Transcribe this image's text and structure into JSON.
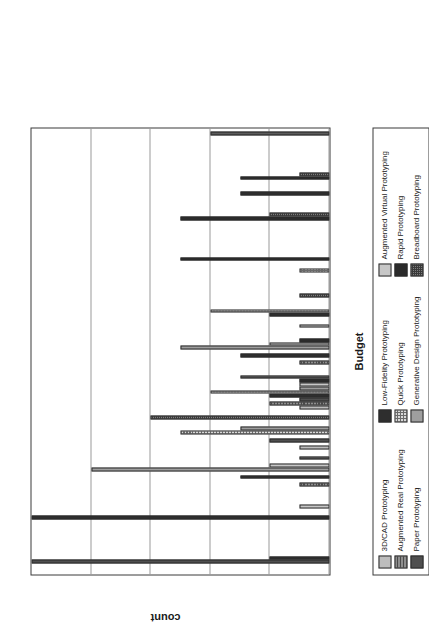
{
  "chart_data": {
    "type": "bar",
    "title": "",
    "xlabel": "Budget",
    "ylabel": "count",
    "categories": [
      "0",
      "1",
      "2",
      "3",
      "4",
      "5",
      "6",
      "7",
      "8",
      "9",
      "10"
    ],
    "xlim": [
      -0.5,
      10.5
    ],
    "ylim": [
      0,
      10
    ],
    "yticks": [
      "0",
      "2",
      "4",
      "6",
      "8",
      "10"
    ],
    "ytick_values": [
      0,
      2,
      4,
      6,
      8,
      10
    ],
    "grid": true,
    "legend_position": "below-plot",
    "orientation": "rotated-90-ccw",
    "series": [
      {
        "name": "3D/CAD Prototyping",
        "swatch": "#bdbdbd",
        "pattern": "solid-light-gray",
        "values": [
          0,
          0,
          0,
          1,
          1,
          0,
          1,
          0,
          0,
          0,
          0
        ]
      },
      {
        "name": "Augmented Real Prototyping",
        "swatch": "#8e8e8e",
        "pattern": "horizontal-lines",
        "values": [
          0,
          0,
          1,
          0,
          2,
          1,
          0,
          0,
          0,
          0,
          0
        ]
      },
      {
        "name": "Paper Prototyping",
        "swatch": "#4f4f4f",
        "pattern": "solid-dark-gray",
        "values": [
          10,
          0,
          0,
          2,
          1,
          0,
          0,
          0,
          0,
          0,
          0
        ]
      },
      {
        "name": "Low-Fidelity Prototyping",
        "swatch": "#2e2e2e",
        "pattern": "solid-near-black",
        "values": [
          2,
          10,
          3,
          0,
          2,
          3,
          2,
          0,
          0,
          3,
          0
        ]
      },
      {
        "name": "Quick Prototyping",
        "swatch": "#d9d9d9",
        "pattern": "fine-checker",
        "values": [
          0,
          0,
          0,
          5,
          4,
          0,
          4,
          1,
          0,
          0,
          0
        ]
      },
      {
        "name": "Generative Design Prototyping",
        "swatch": "#9e9e9e",
        "pattern": "solid-mid-gray",
        "values": [
          0,
          0,
          8,
          3,
          1,
          5,
          0,
          0,
          0,
          0,
          0
        ]
      },
      {
        "name": "Augmented Virtual Prototyping",
        "swatch": "#c7c7c7",
        "pattern": "solid-pale-gray",
        "values": [
          0,
          1,
          2,
          0,
          1,
          2,
          0,
          0,
          0,
          0,
          0
        ]
      },
      {
        "name": "Rapid Prototyping",
        "swatch": "#2b2b2b",
        "pattern": "solid-black",
        "values": [
          0,
          0,
          0,
          0,
          1,
          1,
          0,
          5,
          5,
          3,
          0
        ]
      },
      {
        "name": "Breadboard Prototyping",
        "swatch": "#7d7d7d",
        "pattern": "dense-checker",
        "values": [
          0,
          0,
          1,
          6,
          3,
          0,
          1,
          0,
          2,
          1,
          4
        ]
      }
    ]
  },
  "axis": {
    "ylabel": "count",
    "xlabel": "Budget",
    "ytick_labels": [
      "0",
      "2",
      "4",
      "6",
      "8",
      "10"
    ],
    "xtick_labels": [
      "0",
      "1",
      "2",
      "3",
      "4",
      "5",
      "6",
      "7",
      "8",
      "9",
      "10"
    ]
  },
  "legend": {
    "columns": [
      {
        "items": [
          {
            "label": "3D/CAD Prototyping",
            "series": 0
          },
          {
            "label": "Augmented Real Prototyping",
            "series": 1
          },
          {
            "label": "Paper Prototyping",
            "series": 2
          }
        ]
      },
      {
        "items": [
          {
            "label": "Low-Fidelity Prototyping",
            "series": 3
          },
          {
            "label": "Quick Prototyping",
            "series": 4
          },
          {
            "label": "Generative Design Prototyping",
            "series": 5
          }
        ]
      },
      {
        "items": [
          {
            "label": "Augmented Virtual Prototyping",
            "series": 6
          },
          {
            "label": "Rapid Prototyping",
            "series": 7
          },
          {
            "label": "Breadboard Prototyping",
            "series": 8
          }
        ]
      }
    ]
  }
}
